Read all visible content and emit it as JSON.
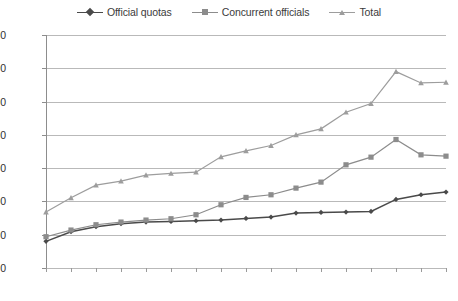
{
  "chart_data": {
    "type": "line",
    "title": "",
    "xlabel": "",
    "ylabel": "",
    "categories": [
      "2000",
      "2001",
      "2002",
      "2003",
      "2004",
      "2005",
      "2006",
      "2007",
      "2008",
      "2009",
      "2010",
      "2011",
      "2012",
      "2013",
      "2014",
      "2015",
      "2016"
    ],
    "ylim": [
      0,
      3500
    ],
    "yticks": [
      0,
      500,
      1000,
      1500,
      2000,
      2500,
      3000,
      3500
    ],
    "grid": true,
    "legend_position": "top-center",
    "series": [
      {
        "name": "Official quotas",
        "color": "#4a4a4a",
        "marker": "diamond",
        "values": [
          400,
          545,
          620,
          665,
          690,
          700,
          710,
          720,
          745,
          765,
          825,
          835,
          840,
          850,
          1030,
          1100,
          1140
        ]
      },
      {
        "name": "Concurrent officials",
        "color": "#8c8c8c",
        "marker": "square",
        "values": [
          470,
          570,
          650,
          690,
          720,
          740,
          800,
          950,
          1060,
          1100,
          1200,
          1290,
          1550,
          1665,
          1930,
          1700,
          1680
        ]
      },
      {
        "name": "Total",
        "color": "#9d9d9d",
        "marker": "triangle",
        "values": [
          840,
          1055,
          1245,
          1305,
          1395,
          1420,
          1440,
          1670,
          1760,
          1840,
          2000,
          2090,
          2340,
          2470,
          2950,
          2780,
          2790
        ]
      }
    ]
  },
  "legend": {
    "items": [
      {
        "label": "Official quotas"
      },
      {
        "label": "Concurrent officials"
      },
      {
        "label": "Total"
      }
    ]
  },
  "axes": {
    "y_labels": [
      "3500",
      "3000",
      "2500",
      "2000",
      "1500",
      "1000",
      "500",
      "0"
    ],
    "x_labels": [
      "2000",
      "2001",
      "2002",
      "2003",
      "2004",
      "2005",
      "2006",
      "2007",
      "2008",
      "2009",
      "2010",
      "2011",
      "2012",
      "2013",
      "2014",
      "2015",
      "2016"
    ]
  }
}
